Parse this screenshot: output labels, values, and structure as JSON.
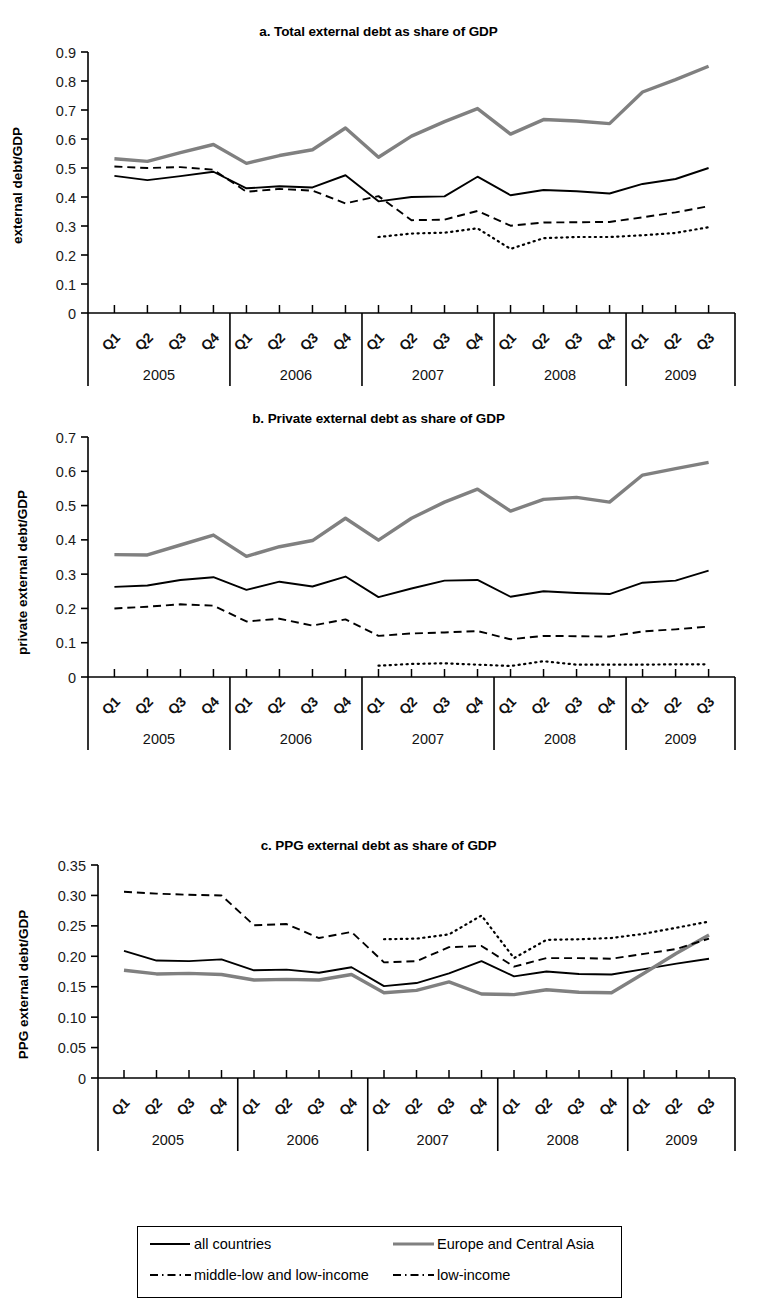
{
  "figure": {
    "background": "#ffffff",
    "series_colors": {
      "all_countries": "#000000",
      "europe_central_asia": "#808080",
      "middle_low_and_low_income": "#000000",
      "low_income": "#000000"
    }
  },
  "legend": {
    "name": "series-legend",
    "entries": [
      {
        "label": "all countries",
        "style": "solid",
        "color": "#000000",
        "width": 1.8
      },
      {
        "label": "Europe and Central Asia",
        "style": "solid",
        "color": "#808080",
        "width": 3.2
      },
      {
        "label": "middle-low and low-income",
        "style": "dashed",
        "color": "#000000",
        "width": 1.8
      },
      {
        "label": "low-income",
        "style": "dashed",
        "color": "#000000",
        "width": 1.8
      }
    ]
  },
  "chart_data": [
    {
      "id": "panel-a",
      "type": "line",
      "title": "a. Total external debt as share of GDP",
      "xlabel": "",
      "ylabel": "external debt/GDP",
      "ylim": [
        0,
        0.9
      ],
      "yticks": [
        0,
        0.1,
        0.2,
        0.3,
        0.4,
        0.5,
        0.6,
        0.7,
        0.8,
        0.9
      ],
      "ytick_labels": [
        "0",
        "0.1",
        "0.2",
        "0.3",
        "0.4",
        "0.5",
        "0.6",
        "0.7",
        "0.8",
        "0.9"
      ],
      "grid": false,
      "x": [
        "2005Q1",
        "2005Q2",
        "2005Q3",
        "2005Q4",
        "2006Q1",
        "2006Q2",
        "2006Q3",
        "2006Q4",
        "2007Q1",
        "2007Q2",
        "2007Q3",
        "2007Q4",
        "2008Q1",
        "2008Q2",
        "2008Q3",
        "2008Q4",
        "2009Q1",
        "2009Q2",
        "2009Q3"
      ],
      "quarter_labels": [
        "Q1",
        "Q2",
        "Q3",
        "Q4",
        "Q1",
        "Q2",
        "Q3",
        "Q4",
        "Q1",
        "Q2",
        "Q3",
        "Q4",
        "Q1",
        "Q2",
        "Q3",
        "Q4",
        "Q1",
        "Q2",
        "Q3"
      ],
      "year_groups": [
        {
          "year": "2005",
          "quarters": 4
        },
        {
          "year": "2006",
          "quarters": 4
        },
        {
          "year": "2007",
          "quarters": 4
        },
        {
          "year": "2008",
          "quarters": 4
        },
        {
          "year": "2009",
          "quarters": 3
        }
      ],
      "series": [
        {
          "name": "all countries",
          "style": "solid",
          "color": "#000000",
          "width": 1.9,
          "values": [
            0.473,
            0.458,
            0.472,
            0.487,
            0.43,
            0.437,
            0.433,
            0.475,
            0.385,
            0.4,
            0.402,
            0.47,
            0.406,
            0.424,
            0.42,
            0.412,
            0.445,
            0.462,
            0.5
          ]
        },
        {
          "name": "Europe and Central Asia",
          "style": "solid",
          "color": "#808080",
          "width": 3.4,
          "values": [
            0.532,
            0.523,
            0.553,
            0.581,
            0.516,
            0.543,
            0.563,
            0.638,
            0.537,
            0.61,
            0.66,
            0.705,
            0.617,
            0.667,
            0.662,
            0.653,
            0.762,
            0.805,
            0.851
          ]
        },
        {
          "name": "middle-low and low-income",
          "style": "dashed",
          "color": "#000000",
          "width": 1.9,
          "values": [
            0.505,
            0.5,
            0.503,
            0.494,
            0.418,
            0.428,
            0.422,
            0.378,
            0.403,
            0.32,
            0.322,
            0.352,
            0.301,
            0.312,
            0.313,
            0.314,
            0.33,
            0.347,
            0.368
          ]
        },
        {
          "name": "low-income",
          "style": "dotted",
          "color": "#000000",
          "width": 2.2,
          "start_index": 8,
          "values": [
            null,
            null,
            null,
            null,
            null,
            null,
            null,
            null,
            0.262,
            0.274,
            0.277,
            0.292,
            0.221,
            0.258,
            0.262,
            0.262,
            0.268,
            0.276,
            0.296
          ]
        }
      ]
    },
    {
      "id": "panel-b",
      "type": "line",
      "title": "b. Private external debt as share of GDP",
      "xlabel": "",
      "ylabel": "private external debt/GDP",
      "ylim": [
        0,
        0.7
      ],
      "yticks": [
        0,
        0.1,
        0.2,
        0.3,
        0.4,
        0.5,
        0.6,
        0.7
      ],
      "ytick_labels": [
        "0",
        "0.1",
        "0.2",
        "0.3",
        "0.4",
        "0.5",
        "0.6",
        "0.7"
      ],
      "grid": false,
      "x": [
        "2005Q1",
        "2005Q2",
        "2005Q3",
        "2005Q4",
        "2006Q1",
        "2006Q2",
        "2006Q3",
        "2006Q4",
        "2007Q1",
        "2007Q2",
        "2007Q3",
        "2007Q4",
        "2008Q1",
        "2008Q2",
        "2008Q3",
        "2008Q4",
        "2009Q1",
        "2009Q2",
        "2009Q3"
      ],
      "quarter_labels": [
        "Q1",
        "Q2",
        "Q3",
        "Q4",
        "Q1",
        "Q2",
        "Q3",
        "Q4",
        "Q1",
        "Q2",
        "Q3",
        "Q4",
        "Q1",
        "Q2",
        "Q3",
        "Q4",
        "Q1",
        "Q2",
        "Q3"
      ],
      "year_groups": [
        {
          "year": "2005",
          "quarters": 4
        },
        {
          "year": "2006",
          "quarters": 4
        },
        {
          "year": "2007",
          "quarters": 4
        },
        {
          "year": "2008",
          "quarters": 4
        },
        {
          "year": "2009",
          "quarters": 3
        }
      ],
      "series": [
        {
          "name": "all countries",
          "style": "solid",
          "color": "#000000",
          "width": 1.9,
          "values": [
            0.263,
            0.267,
            0.283,
            0.291,
            0.254,
            0.278,
            0.264,
            0.293,
            0.233,
            0.258,
            0.281,
            0.283,
            0.234,
            0.25,
            0.245,
            0.242,
            0.275,
            0.281,
            0.31
          ]
        },
        {
          "name": "Europe and Central Asia",
          "style": "solid",
          "color": "#808080",
          "width": 3.4,
          "values": [
            0.357,
            0.356,
            0.385,
            0.414,
            0.352,
            0.38,
            0.398,
            0.463,
            0.399,
            0.463,
            0.51,
            0.548,
            0.484,
            0.518,
            0.524,
            0.51,
            0.589,
            0.608,
            0.626
          ]
        },
        {
          "name": "middle-low and low-income",
          "style": "dashed",
          "color": "#000000",
          "width": 1.9,
          "values": [
            0.2,
            0.205,
            0.212,
            0.208,
            0.162,
            0.17,
            0.15,
            0.168,
            0.12,
            0.127,
            0.13,
            0.134,
            0.11,
            0.12,
            0.119,
            0.118,
            0.133,
            0.139,
            0.147
          ]
        },
        {
          "name": "low-income",
          "style": "dotted",
          "color": "#000000",
          "width": 2.2,
          "start_index": 8,
          "values": [
            null,
            null,
            null,
            null,
            null,
            null,
            null,
            null,
            0.033,
            0.038,
            0.04,
            0.036,
            0.032,
            0.046,
            0.036,
            0.036,
            0.036,
            0.037,
            0.037
          ]
        }
      ]
    },
    {
      "id": "panel-c",
      "type": "line",
      "title": "c. PPG external debt as share of GDP",
      "xlabel": "",
      "ylabel": "PPG external debt/GDP",
      "ylim": [
        0,
        0.35
      ],
      "yticks": [
        0,
        0.05,
        0.1,
        0.15,
        0.2,
        0.25,
        0.3,
        0.35
      ],
      "ytick_labels": [
        "0",
        "0.05",
        "0.10",
        "0.15",
        "0.20",
        "0.25",
        "0.30",
        "0.35"
      ],
      "grid": false,
      "x": [
        "2005Q1",
        "2005Q2",
        "2005Q3",
        "2005Q4",
        "2006Q1",
        "2006Q2",
        "2006Q3",
        "2006Q4",
        "2007Q1",
        "2007Q2",
        "2007Q3",
        "2007Q4",
        "2008Q1",
        "2008Q2",
        "2008Q3",
        "2008Q4",
        "2009Q1",
        "2009Q2",
        "2009Q3"
      ],
      "quarter_labels": [
        "Q1",
        "Q2",
        "Q3",
        "Q4",
        "Q1",
        "Q2",
        "Q3",
        "Q4",
        "Q1",
        "Q2",
        "Q3",
        "Q4",
        "Q1",
        "Q2",
        "Q3",
        "Q4",
        "Q1",
        "Q2",
        "Q3"
      ],
      "year_groups": [
        {
          "year": "2005",
          "quarters": 4
        },
        {
          "year": "2006",
          "quarters": 4
        },
        {
          "year": "2007",
          "quarters": 4
        },
        {
          "year": "2008",
          "quarters": 4
        },
        {
          "year": "2009",
          "quarters": 3
        }
      ],
      "series": [
        {
          "name": "all countries",
          "style": "solid",
          "color": "#000000",
          "width": 1.9,
          "values": [
            0.209,
            0.193,
            0.192,
            0.195,
            0.177,
            0.178,
            0.173,
            0.182,
            0.151,
            0.156,
            0.172,
            0.192,
            0.167,
            0.175,
            0.171,
            0.17,
            0.179,
            0.188,
            0.196
          ]
        },
        {
          "name": "Europe and Central Asia",
          "style": "solid",
          "color": "#808080",
          "width": 3.4,
          "values": [
            0.177,
            0.171,
            0.172,
            0.17,
            0.161,
            0.162,
            0.161,
            0.17,
            0.14,
            0.144,
            0.158,
            0.138,
            0.137,
            0.145,
            0.141,
            0.14,
            0.172,
            0.205,
            0.235
          ]
        },
        {
          "name": "middle-low and low-income",
          "style": "dashed",
          "color": "#000000",
          "width": 1.9,
          "values": [
            0.306,
            0.303,
            0.301,
            0.3,
            0.251,
            0.253,
            0.23,
            0.24,
            0.19,
            0.192,
            0.215,
            0.217,
            0.183,
            0.197,
            0.197,
            0.196,
            0.204,
            0.212,
            0.229
          ]
        },
        {
          "name": "low-income",
          "style": "dotted",
          "color": "#000000",
          "width": 2.2,
          "start_index": 8,
          "values": [
            null,
            null,
            null,
            null,
            null,
            null,
            null,
            null,
            0.228,
            0.229,
            0.236,
            0.267,
            0.197,
            0.227,
            0.228,
            0.23,
            0.237,
            0.247,
            0.257
          ]
        }
      ]
    }
  ]
}
